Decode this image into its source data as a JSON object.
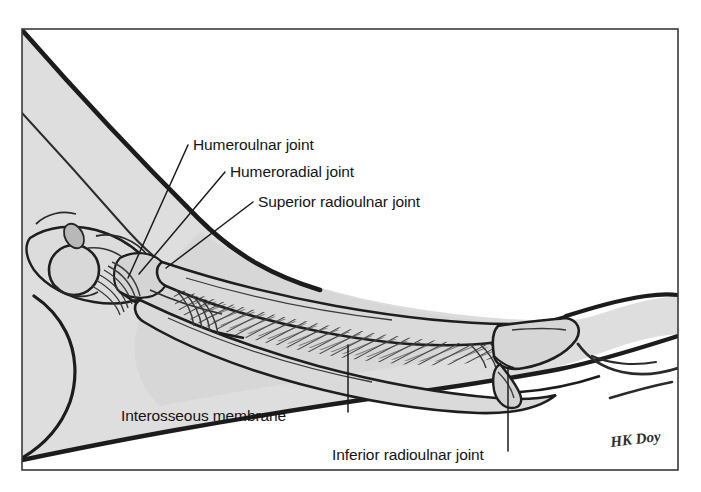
{
  "figure": {
    "type": "anatomical-illustration",
    "frame": {
      "border_color": "#3a3a3a",
      "x": 22,
      "y": 29,
      "width": 656,
      "height": 441
    },
    "colors": {
      "outline": "#1c1c1c",
      "fill_gray": "#dedede",
      "fill_gray_dark": "#c9c9c9",
      "detail_line": "#3c3c3c",
      "label_text": "#141414",
      "leader_line": "#1c1c1c",
      "background": "#ffffff"
    },
    "labels": [
      {
        "id": "humeroulnar-joint",
        "text": "Humeroulnar joint",
        "text_x": 193,
        "text_y": 150,
        "leader": [
          [
            188,
            145
          ],
          [
            128,
            278
          ]
        ]
      },
      {
        "id": "humeroradial-joint",
        "text": "Humeroradial joint",
        "text_x": 230,
        "text_y": 177,
        "leader": [
          [
            225,
            172
          ],
          [
            139,
            274
          ]
        ]
      },
      {
        "id": "superior-radioulnar-joint",
        "text": "Superior radioulnar joint",
        "text_x": 258,
        "text_y": 207,
        "leader": [
          [
            253,
            202
          ],
          [
            166,
            268
          ]
        ]
      },
      {
        "id": "interosseous-membrane",
        "text": "Interosseous membrane",
        "text_x": 121,
        "text_y": 421,
        "leader": [
          [
            348,
            412
          ],
          [
            348,
            345
          ]
        ]
      },
      {
        "id": "inferior-radioulnar-joint",
        "text": "Inferior radioulnar joint",
        "text_x": 332,
        "text_y": 460,
        "leader": [
          [
            508,
            451
          ],
          [
            508,
            368
          ]
        ]
      }
    ],
    "signature": {
      "text": "HK Doy",
      "x": 611,
      "y": 447
    },
    "caption": ""
  }
}
